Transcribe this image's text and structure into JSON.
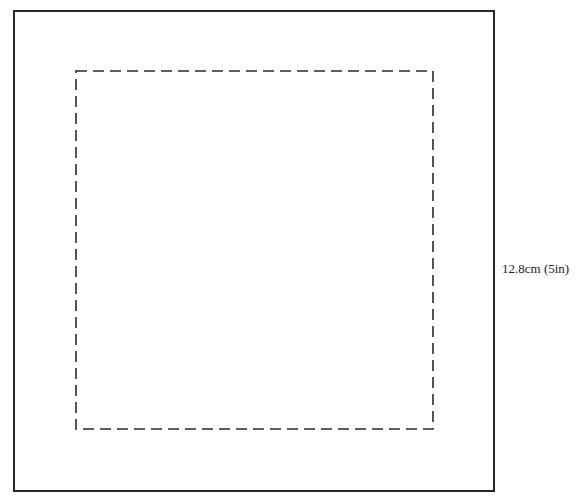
{
  "diagram": {
    "type": "template",
    "outer_square": {
      "style": "solid",
      "color": "#2a2a2a"
    },
    "inner_square": {
      "style": "dashed",
      "color": "#2a2a2a"
    },
    "dimension_label": "12.8cm (5in)"
  }
}
